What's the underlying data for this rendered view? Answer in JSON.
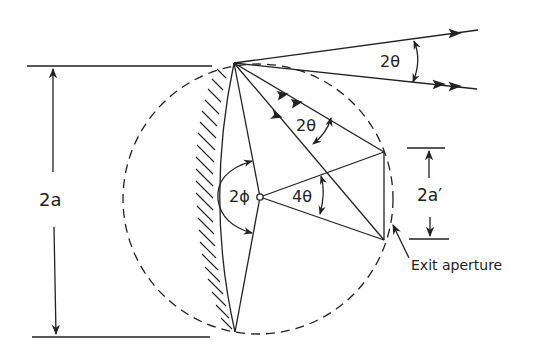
{
  "diagram": {
    "type": "optics-geometry",
    "labels": {
      "full_aperture": "2a",
      "exit_aperture_width": "2a′",
      "input_angle": "2θ",
      "internal_angle": "2θ",
      "center_angle": "4θ",
      "half_angle": "2ϕ",
      "exit_aperture": "Exit aperture"
    },
    "colors": {
      "line": "#222222",
      "background": "#ffffff"
    }
  }
}
